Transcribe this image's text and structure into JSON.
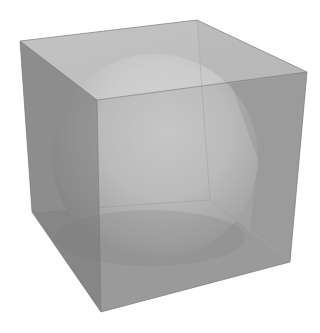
{
  "scene": {
    "description": "Translucent gray cube containing a shaded sphere",
    "background": "#ffffff",
    "cube": {
      "vertices": {
        "back_top_left": [
          20,
          41
        ],
        "back_top_right": [
          197,
          20
        ],
        "right_top": [
          307,
          72
        ],
        "front_top": [
          97,
          100
        ],
        "left_bottom": [
          32,
          212
        ],
        "front_bottom": [
          101,
          312
        ],
        "right_bottom": [
          290,
          262
        ],
        "back_bottom": [
          210,
          200
        ]
      },
      "colors": {
        "top_face": "#c6c6c6",
        "left_face": "#888888",
        "right_face": "#959595",
        "edge": "#7a7a7a"
      }
    },
    "sphere": {
      "center": [
        155,
        157
      ],
      "radius": 103,
      "highlight": "#e4e4e4",
      "midtone": "#b5b5b5",
      "shadow": "#7e7e7e"
    }
  }
}
